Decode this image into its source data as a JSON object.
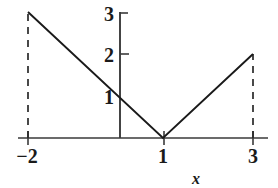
{
  "figure": {
    "background_color": "#ffffff",
    "line_color": "#1a1a1a",
    "axis_color": "#3a3a3a"
  },
  "axes": {
    "x_axis_label": "x",
    "y_axis_label": "",
    "x_ticks": [
      {
        "value": -2,
        "label": "−2",
        "px": 28
      },
      {
        "value": 1,
        "label": "1",
        "px": 164
      },
      {
        "value": 3,
        "label": "3",
        "px": 253
      }
    ],
    "y_ticks": [
      {
        "value": 1,
        "label": "1",
        "px": 96
      },
      {
        "value": 2,
        "label": "2",
        "px": 54
      },
      {
        "value": 3,
        "label": "3",
        "px": 13
      }
    ],
    "origin_px": {
      "x": 120,
      "y": 138
    },
    "x_axis_extent_px": {
      "start": 18,
      "end": 268
    },
    "y_axis_extent_px": {
      "top": 12,
      "bottom": 138
    }
  },
  "chart_data": {
    "type": "line",
    "title": "",
    "subtitle": "",
    "xlabel": "x",
    "ylabel": "",
    "xlim": [
      -2.25,
      3.3
    ],
    "ylim": [
      0,
      3.1
    ],
    "grid": false,
    "legend": null,
    "xticks": [
      -2,
      1,
      3
    ],
    "xticklabels": [
      "−2",
      "1",
      "3"
    ],
    "yticks": [
      1,
      2,
      3
    ],
    "yticklabels": [
      "1",
      "2",
      "3"
    ],
    "series": [
      {
        "name": "f(x) = |x - 1|",
        "style": "solid",
        "x": [
          -2,
          1,
          3
        ],
        "y": [
          3,
          0,
          2
        ]
      }
    ],
    "annotations": [
      {
        "type": "dashed-vertical",
        "x": -2,
        "y_from": 0,
        "y_to": 3
      },
      {
        "type": "dashed-vertical",
        "x": 3,
        "y_from": 0,
        "y_to": 2
      }
    ],
    "endpoints": [
      {
        "x": -2,
        "y": 3
      },
      {
        "x": 1,
        "y": 0
      },
      {
        "x": 3,
        "y": 2
      }
    ]
  }
}
